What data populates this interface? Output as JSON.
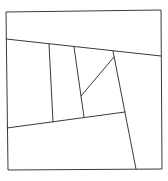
{
  "diagram": {
    "type": "line-partition",
    "width": 168,
    "height": 181,
    "background": "#ffffff",
    "stroke_color": "#3a3a3a",
    "outer_frame": {
      "points": [
        [
          6,
          12
        ],
        [
          161,
          10
        ],
        [
          162,
          169
        ],
        [
          8,
          170
        ]
      ]
    },
    "segments": [
      {
        "name": "upper-sloped-line",
        "from": [
          6,
          39
        ],
        "to": [
          161,
          56
        ]
      },
      {
        "name": "lower-sloped-line",
        "from": [
          7,
          128
        ],
        "to": [
          125,
          112
        ]
      },
      {
        "name": "vertical-line-left",
        "from": [
          49,
          44
        ],
        "to": [
          53,
          122
        ]
      },
      {
        "name": "vertical-line-middle",
        "from": [
          74,
          47
        ],
        "to": [
          84,
          117
        ]
      },
      {
        "name": "diagonal-short",
        "from": [
          114,
          57
        ],
        "to": [
          81,
          96
        ]
      },
      {
        "name": "long-tilted-line",
        "from": [
          113,
          51
        ],
        "to": [
          136,
          169
        ]
      }
    ]
  }
}
